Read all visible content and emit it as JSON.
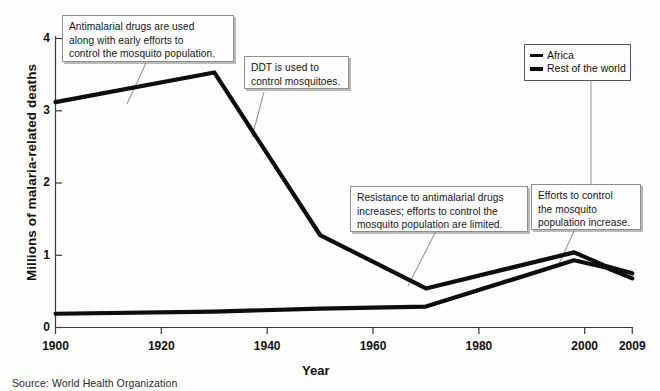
{
  "chart_data": {
    "type": "line",
    "title": "",
    "xlabel": "Year",
    "ylabel": "Millions of malaria-related deaths",
    "xlim": [
      1900,
      2009
    ],
    "ylim": [
      0,
      4
    ],
    "xticks": [
      1900,
      1920,
      1940,
      1960,
      1980,
      2000,
      2009
    ],
    "yticks": [
      0,
      1,
      2,
      3,
      4
    ],
    "grid": false,
    "legend_position": "top-right",
    "series": [
      {
        "name": "Africa",
        "x": [
          1900,
          1930,
          1950,
          1970,
          1998,
          2004,
          2009
        ],
        "values": [
          3.12,
          3.53,
          1.28,
          0.54,
          1.04,
          0.85,
          0.75
        ]
      },
      {
        "name": "Rest of the world",
        "x": [
          1900,
          1930,
          1950,
          1970,
          1998,
          2004,
          2009
        ],
        "values": [
          0.19,
          0.22,
          0.26,
          0.29,
          0.93,
          0.83,
          0.68
        ]
      }
    ],
    "annotations": [
      "Antimalarial drugs are used along with early efforts to control the mosquito population.",
      "DDT is used to control mosquitoes.",
      "Resistance to antimalarial drugs increases; efforts to control the mosquito population are limited.",
      "Efforts to control the mosquito population increase."
    ],
    "source": "Source: World Health Organization"
  },
  "axes": {
    "ylabel": "Millions of malaria-related deaths",
    "xlabel": "Year",
    "yticks": [
      "0",
      "1",
      "2",
      "3",
      "4"
    ],
    "xticks": [
      "1900",
      "1920",
      "1940",
      "1960",
      "1980",
      "2000",
      "2009"
    ]
  },
  "legend": {
    "items": [
      {
        "label": "Africa"
      },
      {
        "label": "Rest of the world"
      }
    ]
  },
  "callouts": [
    {
      "id": "antimalarial-drugs",
      "line1": "Antimalarial drugs are used",
      "line2": "along with early efforts to",
      "line3": "control the mosquito population."
    },
    {
      "id": "ddt",
      "line1": "DDT is used to",
      "line2": "control mosquitoes.",
      "line3": ""
    },
    {
      "id": "resistance",
      "line1": "Resistance to antimalarial drugs",
      "line2": "increases; efforts to control the",
      "line3": "mosquito population are limited."
    },
    {
      "id": "efforts-increase",
      "line1": "Efforts to control",
      "line2": "the mosquito",
      "line3": "population increase."
    }
  ],
  "source": {
    "text": "Source: World Health Organization"
  },
  "colors": {
    "line": "#0d0d0d",
    "axis": "#3a3a3a",
    "callout_border": "#8d8d8d",
    "background": "#fdfdfb"
  }
}
